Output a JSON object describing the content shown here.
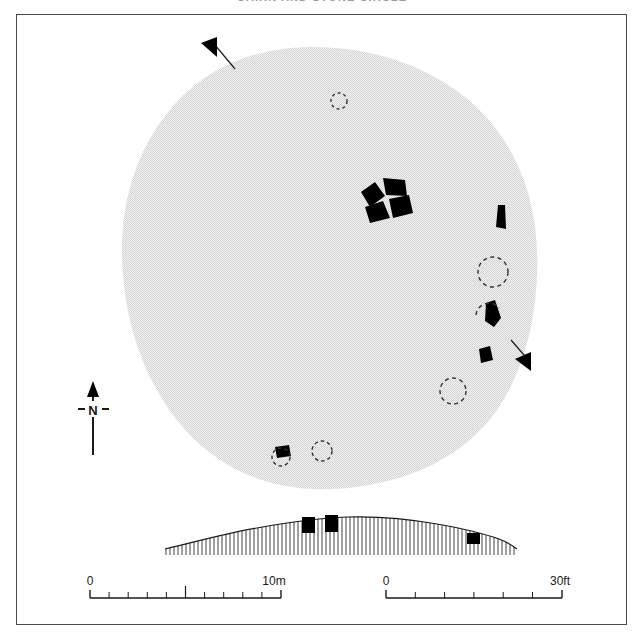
{
  "figure": {
    "title": "CAIRN AND STONE CIRCLE",
    "plate_border_color": "#4a4a4a"
  },
  "north_arrow": {
    "label": "N",
    "name": "north-arrow",
    "direction": "up"
  },
  "scales": [
    {
      "id": "metric",
      "start_label": "0",
      "end_label": "10m",
      "units": "m",
      "total": 10,
      "divisions": 10,
      "major_tick_at": 5
    },
    {
      "id": "imperial",
      "start_label": "0",
      "end_label": "30ft",
      "units": "ft",
      "total": 30,
      "divisions": 6,
      "major_tick_at": 15
    }
  ],
  "plan": {
    "mound_label": "cairn-mound",
    "mound_fill": "#e8e8e8",
    "stone_fill": "#000000",
    "socket_stroke": "#333333",
    "stones": [
      {
        "name": "central-cist-stone-nw"
      },
      {
        "name": "central-cist-stone-ne"
      },
      {
        "name": "central-cist-stone-sw"
      },
      {
        "name": "central-cist-stone-se"
      },
      {
        "name": "circle-stone-east-upper"
      },
      {
        "name": "circle-stone-east-middle"
      },
      {
        "name": "circle-stone-east-lower"
      },
      {
        "name": "circle-stone-south"
      }
    ],
    "sockets": [
      {
        "name": "empty-socket-north"
      },
      {
        "name": "empty-socket-east-upper"
      },
      {
        "name": "empty-socket-east-middle"
      },
      {
        "name": "empty-socket-southeast"
      },
      {
        "name": "empty-socket-south-west"
      },
      {
        "name": "empty-socket-south-east"
      }
    ],
    "section_markers": [
      {
        "name": "section-marker-nw",
        "direction": "up-left"
      },
      {
        "name": "section-marker-se",
        "direction": "down-right"
      }
    ]
  },
  "section": {
    "name": "mound-profile-section",
    "hachure_color": "#2a2a2a",
    "stones": [
      {
        "name": "section-stone-left"
      },
      {
        "name": "section-stone-right-of-centre"
      },
      {
        "name": "section-stone-far-right"
      }
    ]
  }
}
